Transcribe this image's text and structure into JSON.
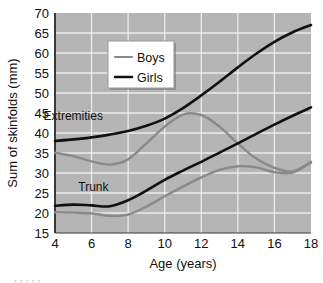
{
  "chart_data": {
    "type": "line",
    "title": "",
    "xlabel": "Age (years)",
    "ylabel": "Sum of skinfolds (mm)",
    "xlim": [
      4,
      18
    ],
    "ylim": [
      15,
      70
    ],
    "xticks": [
      4,
      6,
      8,
      10,
      12,
      14,
      16,
      18
    ],
    "yticks": [
      15,
      20,
      25,
      30,
      35,
      40,
      45,
      50,
      55,
      60,
      65,
      70
    ],
    "grid": true,
    "grid_color": "#f2f2f2",
    "plot_background": "#b5b5b5",
    "legend": {
      "position": "top-center",
      "entries": [
        {
          "name": "Boys",
          "color": "#8a8a8a"
        },
        {
          "name": "Girls",
          "color": "#111111"
        }
      ]
    },
    "annotations": [
      {
        "text": "Extremities",
        "x": 5.0,
        "y": 43.2
      },
      {
        "text": "Trunk",
        "x": 6.1,
        "y": 25.4
      }
    ],
    "series": [
      {
        "name": "Girls Extremities",
        "group": "Extremities",
        "sex": "Girls",
        "color": "#111111",
        "width": 2.6,
        "x": [
          4,
          5,
          6,
          7,
          8,
          9,
          10,
          11,
          12,
          13,
          14,
          15,
          16,
          17,
          18
        ],
        "y": [
          38.0,
          38.4,
          38.9,
          39.6,
          40.5,
          41.8,
          43.6,
          46.2,
          49.4,
          52.8,
          56.4,
          59.8,
          62.8,
          65.2,
          67.0
        ]
      },
      {
        "name": "Boys Extremities",
        "group": "Extremities",
        "sex": "Boys",
        "color": "#8a8a8a",
        "width": 2.4,
        "x": [
          4,
          5,
          6,
          7,
          8,
          9,
          10,
          11,
          12,
          13,
          14,
          15,
          16,
          17,
          18
        ],
        "y": [
          35.1,
          34.2,
          32.9,
          32.1,
          33.4,
          37.4,
          41.6,
          44.6,
          44.5,
          41.6,
          37.4,
          33.6,
          31.3,
          30.4,
          32.8
        ]
      },
      {
        "name": "Girls Trunk",
        "group": "Trunk",
        "sex": "Girls",
        "color": "#111111",
        "width": 2.6,
        "x": [
          4,
          5,
          6,
          7,
          8,
          9,
          10,
          11,
          12,
          13,
          14,
          15,
          16,
          17,
          18
        ],
        "y": [
          21.8,
          22.1,
          21.9,
          21.7,
          23.2,
          25.6,
          28.3,
          30.6,
          32.8,
          35.1,
          37.4,
          39.8,
          42.1,
          44.3,
          46.4
        ]
      },
      {
        "name": "Boys Trunk",
        "group": "Trunk",
        "sex": "Boys",
        "color": "#8a8a8a",
        "width": 2.4,
        "x": [
          4,
          5,
          6,
          7,
          8,
          9,
          10,
          11,
          12,
          13,
          14,
          15,
          16,
          17,
          18
        ],
        "y": [
          20.2,
          20.1,
          19.9,
          19.3,
          19.6,
          21.6,
          24.2,
          26.6,
          28.9,
          30.8,
          31.7,
          31.4,
          30.2,
          30.1,
          32.6
        ]
      }
    ]
  },
  "figure": {
    "caption": "             ,          ,                        ,                    ,            ,           "
  }
}
